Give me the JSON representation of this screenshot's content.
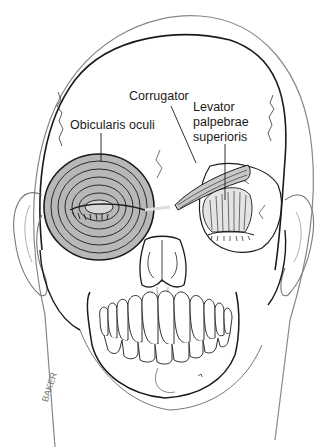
{
  "figure": {
    "labels": {
      "corrugator": "Corrugator",
      "orbicularis": "Obicularis oculi",
      "levator_line1": "Levator",
      "levator_line2": "palpebrae",
      "levator_line3": "superioris"
    },
    "signature": "BAKER",
    "colors": {
      "line": "#1a1a1a",
      "muscle_fill": "#b8b8b8",
      "background": "#ffffff"
    }
  }
}
